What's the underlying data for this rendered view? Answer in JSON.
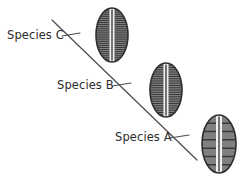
{
  "figure": {
    "width": 242,
    "height": 177,
    "background_color": "#ffffff"
  },
  "colors": {
    "background": "#ffffff",
    "line": "#4a4a4a",
    "text": "#2b2b2b",
    "cell_outline": "#2e2e2e",
    "cell_fill": "#808080",
    "cell_striation": "#3a3a3a",
    "cell_raphe_band": "#f2f2f2",
    "cell_raphe_line": "#2e2e2e"
  },
  "trend_line": {
    "name": "diagonal-trend-line",
    "x1": 52,
    "y1": 20,
    "x2": 197,
    "y2": 160,
    "stroke_width": 1.2
  },
  "labels": [
    {
      "id": "species-c",
      "text": "Species C",
      "x": 7,
      "y": 30,
      "leader": {
        "x1": 62,
        "y1": 36,
        "x2": 80,
        "y2": 33
      }
    },
    {
      "id": "species-b",
      "text": "Species B",
      "x": 57,
      "y": 80,
      "leader": {
        "x1": 112,
        "y1": 86,
        "x2": 131,
        "y2": 83
      }
    },
    {
      "id": "species-a",
      "text": "Species A",
      "x": 115,
      "y": 132,
      "leader": {
        "x1": 170,
        "y1": 138,
        "x2": 189,
        "y2": 135
      }
    }
  ],
  "cells": [
    {
      "id": "cell-species-c",
      "label_ref": "Species C",
      "cx": 112,
      "cy": 35,
      "rx": 16,
      "ry": 27,
      "striation_count": 26,
      "striation_spacing": "dense",
      "raphe_width": 5
    },
    {
      "id": "cell-species-b",
      "label_ref": "Species B",
      "cx": 166,
      "cy": 90,
      "rx": 16,
      "ry": 27,
      "striation_count": 24,
      "striation_spacing": "dense",
      "raphe_width": 5
    },
    {
      "id": "cell-species-a",
      "label_ref": "Species A",
      "cx": 219,
      "cy": 144,
      "rx": 17,
      "ry": 29,
      "striation_count": 7,
      "striation_spacing": "sparse",
      "raphe_width": 6
    }
  ]
}
